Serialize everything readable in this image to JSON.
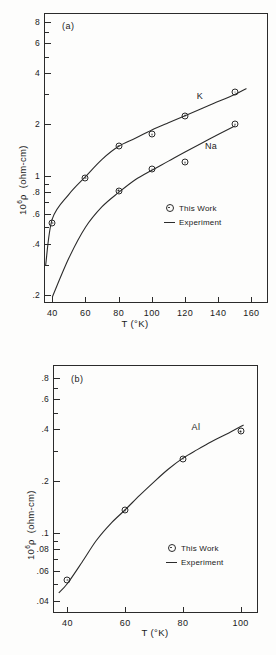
{
  "figure": {
    "background": "#fdfdfc",
    "ink": "#2b2b2b",
    "panel_a_tag": "(a)",
    "panel_b_tag": "(b)"
  },
  "legend": {
    "this_work": "This Work",
    "experiment": "Experiment",
    "marker_icon": "circle-dot-marker",
    "line_icon": "solid-line-swatch"
  },
  "chart_data": [
    {
      "id": "panel-a",
      "type": "scatter",
      "title": "(a)",
      "xlabel": "T (°K)",
      "ylabel": "10⁶ ρ  (ohm-cm)",
      "xscale": "linear",
      "yscale": "log",
      "xlim": [
        35,
        170
      ],
      "ylim": [
        0.18,
        9.0
      ],
      "grid": false,
      "xticks": [
        40,
        60,
        80,
        100,
        120,
        140,
        160
      ],
      "xticklabels": [
        "40",
        "60",
        "80",
        "100",
        "120",
        "140",
        "160"
      ],
      "yticks": [
        0.2,
        0.4,
        0.6,
        0.8,
        1,
        2,
        4,
        6,
        8
      ],
      "yticklabels": [
        ".2",
        ".4",
        ".6",
        ".8",
        "1",
        "2",
        "4",
        "6",
        "8"
      ],
      "yminor": [
        0.3,
        0.5,
        0.7,
        0.9,
        3,
        5,
        7
      ],
      "legend_position": "center-right-inside",
      "annotations": [
        {
          "text": "K",
          "x": 127,
          "y": 2.85
        },
        {
          "text": "Na",
          "x": 132,
          "y": 1.45
        }
      ],
      "series": [
        {
          "name": "K",
          "marker": "circle-dot",
          "line": "Experiment",
          "points": [
            {
              "x": 40,
              "y": 0.53
            },
            {
              "x": 60,
              "y": 0.97
            },
            {
              "x": 80,
              "y": 1.5
            },
            {
              "x": 100,
              "y": 1.75
            },
            {
              "x": 120,
              "y": 2.25
            },
            {
              "x": 150,
              "y": 3.1
            }
          ],
          "curve": [
            {
              "x": 36,
              "y": 0.3
            },
            {
              "x": 40,
              "y": 0.56
            },
            {
              "x": 50,
              "y": 0.78
            },
            {
              "x": 60,
              "y": 0.99
            },
            {
              "x": 70,
              "y": 1.25
            },
            {
              "x": 80,
              "y": 1.49
            },
            {
              "x": 90,
              "y": 1.66
            },
            {
              "x": 100,
              "y": 1.86
            },
            {
              "x": 110,
              "y": 2.05
            },
            {
              "x": 120,
              "y": 2.25
            },
            {
              "x": 135,
              "y": 2.6
            },
            {
              "x": 150,
              "y": 3.0
            },
            {
              "x": 157,
              "y": 3.25
            }
          ]
        },
        {
          "name": "Na",
          "marker": "circle-dot",
          "line": "Experiment",
          "points": [
            {
              "x": 80,
              "y": 0.82
            },
            {
              "x": 100,
              "y": 1.1
            },
            {
              "x": 120,
              "y": 1.2
            },
            {
              "x": 150,
              "y": 2.0
            }
          ],
          "curve": [
            {
              "x": 40,
              "y": 0.195
            },
            {
              "x": 50,
              "y": 0.33
            },
            {
              "x": 60,
              "y": 0.5
            },
            {
              "x": 70,
              "y": 0.66
            },
            {
              "x": 80,
              "y": 0.8
            },
            {
              "x": 90,
              "y": 0.95
            },
            {
              "x": 100,
              "y": 1.08
            },
            {
              "x": 110,
              "y": 1.22
            },
            {
              "x": 120,
              "y": 1.38
            },
            {
              "x": 135,
              "y": 1.65
            },
            {
              "x": 150,
              "y": 1.96
            }
          ]
        }
      ]
    },
    {
      "id": "panel-b",
      "type": "scatter",
      "title": "(b)",
      "xlabel": "T (°K)",
      "ylabel": "10⁶ ρ  (ohm-cm)",
      "xscale": "linear",
      "yscale": "log",
      "xlim": [
        35,
        106
      ],
      "ylim": [
        0.034,
        0.95
      ],
      "grid": false,
      "xticks": [
        40,
        60,
        80,
        100
      ],
      "xticklabels": [
        "40",
        "60",
        "80",
        "100"
      ],
      "yticks": [
        0.04,
        0.06,
        0.08,
        0.1,
        0.2,
        0.4,
        0.6,
        0.8
      ],
      "yticklabels": [
        ".04",
        ".06",
        ".08",
        ".1",
        ".2",
        ".4",
        ".6",
        ".8"
      ],
      "yminor": [
        0.05,
        0.07,
        0.09,
        0.3,
        0.5,
        0.7
      ],
      "legend_position": "lower-right-inside",
      "annotations": [
        {
          "text": "Al",
          "x": 83,
          "y": 0.4
        }
      ],
      "series": [
        {
          "name": "Al",
          "marker": "circle-dot",
          "line": "Experiment",
          "points": [
            {
              "x": 40,
              "y": 0.053
            },
            {
              "x": 60,
              "y": 0.135
            },
            {
              "x": 80,
              "y": 0.27
            },
            {
              "x": 100,
              "y": 0.39
            }
          ],
          "curve": [
            {
              "x": 37,
              "y": 0.0445
            },
            {
              "x": 40,
              "y": 0.0505
            },
            {
              "x": 45,
              "y": 0.067
            },
            {
              "x": 50,
              "y": 0.09
            },
            {
              "x": 55,
              "y": 0.113
            },
            {
              "x": 60,
              "y": 0.136
            },
            {
              "x": 65,
              "y": 0.165
            },
            {
              "x": 70,
              "y": 0.198
            },
            {
              "x": 75,
              "y": 0.235
            },
            {
              "x": 80,
              "y": 0.272
            },
            {
              "x": 85,
              "y": 0.305
            },
            {
              "x": 90,
              "y": 0.34
            },
            {
              "x": 95,
              "y": 0.375
            },
            {
              "x": 101,
              "y": 0.425
            }
          ]
        }
      ]
    }
  ],
  "captions": {
    "mid_axis_title": "T (°K)",
    "bottom_axis_title": "T (°K)"
  }
}
